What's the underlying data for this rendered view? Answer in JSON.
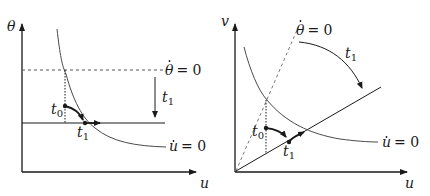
{
  "left_panel": {
    "y_axis_label": "θ",
    "x_axis_label": "u",
    "theta_nullcline": {
      "var": "θ",
      "eq": "= 0"
    },
    "u_nullcline": {
      "var": "u",
      "eq": "= 0"
    },
    "shift_label": {
      "var": "t",
      "sub": "1"
    },
    "point_t0": {
      "var": "t",
      "sub": "0"
    },
    "point_t1": {
      "var": "t",
      "sub": "1"
    }
  },
  "right_panel": {
    "y_axis_label": "v",
    "x_axis_label": "u",
    "theta_nullcline": {
      "var": "θ",
      "eq": "= 0"
    },
    "u_nullcline": {
      "var": "u",
      "eq": "= 0"
    },
    "rotation_label": {
      "var": "t",
      "sub": "1"
    },
    "point_t0": {
      "var": "t",
      "sub": "0"
    },
    "point_t1": {
      "var": "t",
      "sub": "1"
    }
  },
  "colors": {
    "ink": "#1a1a1a",
    "curve": "#4a4a4a",
    "dashed": "#777777"
  }
}
